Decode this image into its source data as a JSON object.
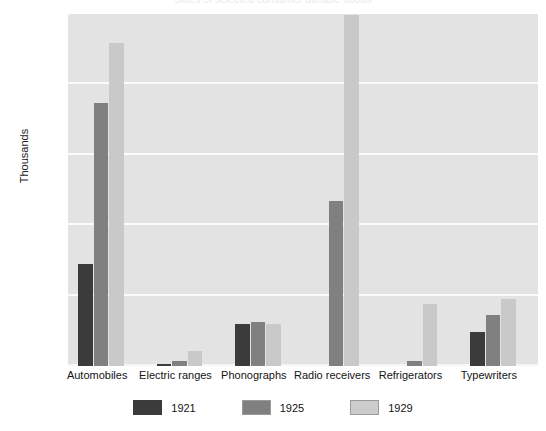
{
  "chart_data": {
    "type": "bar",
    "title": "Sales of selected consumer durable goods",
    "xlabel": "",
    "ylabel": "Thousands",
    "ylim": [
      0,
      5000
    ],
    "yticks": [
      0,
      1000,
      2000,
      3000,
      4000,
      5000
    ],
    "ytick_labels": [
      "0",
      "1,000",
      "2,000",
      "3,000",
      "4,000",
      "5,000"
    ],
    "grid": true,
    "legend_position": "bottom",
    "categories": [
      "Automobiles",
      "Electric ranges",
      "Phonographs",
      "Radio receivers",
      "Refrigerators",
      "Typewriters"
    ],
    "series": [
      {
        "name": "1921",
        "color": "#3b3b3b",
        "values": [
          1450,
          25,
          600,
          0,
          5,
          480
        ]
      },
      {
        "name": "1925",
        "color": "#808080",
        "values": [
          3730,
          75,
          620,
          2340,
          75,
          720
        ]
      },
      {
        "name": "1929",
        "color": "#c9c9c9",
        "values": [
          4590,
          215,
          600,
          4980,
          880,
          950
        ]
      }
    ]
  },
  "legend": {
    "items": [
      {
        "label": "1921",
        "swatch": "dark-gray-swatch"
      },
      {
        "label": "1925",
        "swatch": "medium-gray-swatch"
      },
      {
        "label": "1929",
        "swatch": "light-gray-swatch"
      }
    ]
  }
}
